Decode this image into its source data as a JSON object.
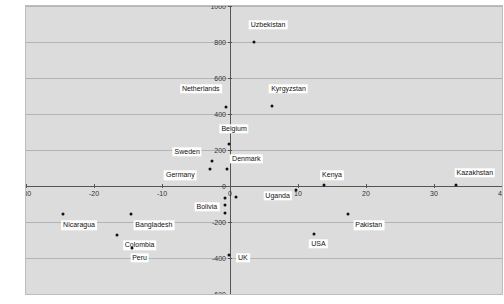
{
  "chart_data": {
    "type": "scatter",
    "title": "",
    "xlabel": "",
    "ylabel": "Deviation in nurse and midwife density",
    "xlim": [
      -30,
      40
    ],
    "ylim": [
      -600,
      1000
    ],
    "xticks": [
      -30,
      -20,
      -10,
      0,
      10,
      20,
      30,
      40
    ],
    "yticks": [
      -600,
      -400,
      -200,
      0,
      200,
      400,
      600,
      800,
      1000
    ],
    "xtick_labels": [
      "-30",
      "-20",
      "-10",
      "0",
      "10",
      "20",
      "30",
      "40"
    ],
    "ytick_labels": [
      "-600",
      "-400",
      "-200",
      "0",
      "200",
      "400",
      "600",
      "800",
      "1000"
    ],
    "grid": "horizontal",
    "legend": "none",
    "marker_color": "#111111",
    "background_color": "#dcdcdc",
    "gridline_color": "#b4b4b4",
    "axis_color": "#555555",
    "points": [
      {
        "label": "Uzbekistan",
        "x": 3.6,
        "y": 800,
        "lx": 5.6,
        "ly": 895
      },
      {
        "label": "Kyrgyzstan",
        "x": 6.2,
        "y": 445,
        "ly": 540,
        "lx": 8.6
      },
      {
        "label": "Netherlands",
        "x": -0.6,
        "y": 440,
        "lx": -4.3,
        "ly": 540
      },
      {
        "label": "Belgium",
        "x": -0.2,
        "y": 235,
        "lx": 0.6,
        "ly": 318
      },
      {
        "label": "Sweden",
        "x": -2.6,
        "y": 140,
        "lx": -6.3,
        "ly": 190
      },
      {
        "label": "Denmark",
        "x": -0.4,
        "y": 95,
        "lx": 2.4,
        "ly": 150
      },
      {
        "label": "Germany",
        "x": -2.9,
        "y": 95,
        "lx": -7.3,
        "ly": 60
      },
      {
        "label": "Kazakhstan",
        "x": 33.2,
        "y": 5,
        "lx": 36.0,
        "ly": 75
      },
      {
        "label": "Kenya",
        "x": 13.8,
        "y": 5,
        "lx": 15.0,
        "ly": 60
      },
      {
        "label": "Uganda",
        "x": 9.7,
        "y": -20,
        "lx": 7.0,
        "ly": -55
      },
      {
        "label": "Bolivia",
        "x": -0.7,
        "y": -65,
        "lx": -3.4,
        "ly": -115
      },
      {
        "label": "Nicaragua",
        "x": -24.5,
        "y": -155,
        "lx": -22.2,
        "ly": -218
      },
      {
        "label": "Bangladesh",
        "x": -14.5,
        "y": -155,
        "lx": -11.2,
        "ly": -218
      },
      {
        "label": "Pakistan",
        "x": 17.3,
        "y": -155,
        "lx": 20.4,
        "ly": -218
      },
      {
        "label": "USA",
        "x": 12.4,
        "y": -265,
        "lx": 13.0,
        "ly": -320
      },
      {
        "label": "Colombia",
        "x": -16.6,
        "y": -270,
        "lx": -13.3,
        "ly": -330
      },
      {
        "label": "Peru",
        "x": -14.4,
        "y": -345,
        "lx": -13.3,
        "ly": -400
      },
      {
        "label": "UK",
        "x": -0.2,
        "y": -385,
        "lx": 1.9,
        "ly": -400
      }
    ],
    "extra_points": [
      {
        "x": 0.9,
        "y": -60
      },
      {
        "x": -0.7,
        "y": -105
      },
      {
        "x": -0.7,
        "y": -150
      }
    ]
  }
}
